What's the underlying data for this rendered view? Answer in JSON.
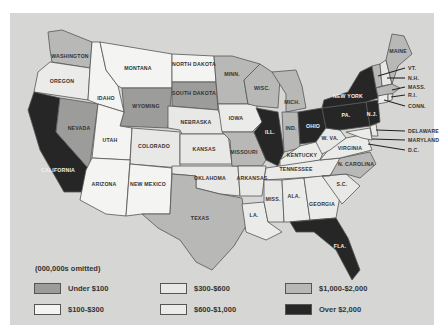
{
  "legend": {
    "title": "(000,000s omitted)",
    "items": [
      {
        "label": "Under $100",
        "color": "#9c9c9a"
      },
      {
        "label": "$100-$300",
        "color": "#f4f4f2"
      },
      {
        "label": "$300-$600",
        "color": "#e8e8e6"
      },
      {
        "label": "$600-$1,000",
        "color": "#ebebea"
      },
      {
        "label": "$1,000-$2,000",
        "color": "#b8b8b6"
      },
      {
        "label": "Over $2,000",
        "color": "#262626"
      }
    ]
  },
  "states": [
    {
      "label": "WASHINGTON",
      "category": "$1,000-$2,000"
    },
    {
      "label": "OREGON",
      "category": "$600-$1,000"
    },
    {
      "label": "CALIFORNIA",
      "category": "Over $2,000"
    },
    {
      "label": "NEVADA",
      "category": "Under $100"
    },
    {
      "label": "IDAHO",
      "category": "$100-$300"
    },
    {
      "label": "MONTANA",
      "category": "$100-$300"
    },
    {
      "label": "WYOMING",
      "category": "Under $100"
    },
    {
      "label": "UTAH",
      "category": "$100-$300"
    },
    {
      "label": "ARIZONA",
      "category": "$100-$300"
    },
    {
      "label": "COLORADO",
      "category": "$300-$600"
    },
    {
      "label": "NEW MEXICO",
      "category": "$100-$300"
    },
    {
      "label": "NORTH DAKOTA",
      "category": "$100-$300"
    },
    {
      "label": "SOUTH DAKOTA",
      "category": "Under $100"
    },
    {
      "label": "NEBRASKA",
      "category": "$300-$600"
    },
    {
      "label": "KANSAS",
      "category": "$300-$600"
    },
    {
      "label": "OKLAHOMA",
      "category": "$300-$600"
    },
    {
      "label": "TEXAS",
      "category": "$1,000-$2,000"
    },
    {
      "label": "MINN.",
      "category": "$1,000-$2,000"
    },
    {
      "label": "IOWA",
      "category": "$600-$1,000"
    },
    {
      "label": "MISSOURI",
      "category": "$1,000-$2,000"
    },
    {
      "label": "ARKANSAS",
      "category": "$300-$600"
    },
    {
      "label": "LA.",
      "category": "$600-$1,000"
    },
    {
      "label": "WISC.",
      "category": "$1,000-$2,000"
    },
    {
      "label": "ILL.",
      "category": "Over $2,000"
    },
    {
      "label": "MICH.",
      "category": "$1,000-$2,000"
    },
    {
      "label": "IND.",
      "category": "$1,000-$2,000"
    },
    {
      "label": "OHIO",
      "category": "Over $2,000"
    },
    {
      "label": "KENTUCKY",
      "category": "$600-$1,000"
    },
    {
      "label": "TENNESSEE",
      "category": "$600-$1,000"
    },
    {
      "label": "MISS.",
      "category": "$300-$600"
    },
    {
      "label": "ALA.",
      "category": "$600-$1,000"
    },
    {
      "label": "GEORGIA",
      "category": "$600-$1,000"
    },
    {
      "label": "FLA.",
      "category": "Over $2,000"
    },
    {
      "label": "S.C.",
      "category": "$300-$600"
    },
    {
      "label": "N. CAROLINA",
      "category": "$1,000-$2,000"
    },
    {
      "label": "VIRGINIA",
      "category": "$600-$1,000"
    },
    {
      "label": "W. VA.",
      "category": "$300-$600"
    },
    {
      "label": "PA.",
      "category": "Over $2,000"
    },
    {
      "label": "NEW YORK",
      "category": "Over $2,000"
    },
    {
      "label": "N.J.",
      "category": "Over $2,000"
    },
    {
      "label": "MAINE",
      "category": "$1,000-$2,000"
    },
    {
      "label": "VT.",
      "category": "$1,000-$2,000"
    },
    {
      "label": "N.H.",
      "category": "$300-$600"
    },
    {
      "label": "MASS.",
      "category": "$1,000-$2,000"
    },
    {
      "label": "R.I.",
      "category": "$300-$600"
    },
    {
      "label": "CONN.",
      "category": "$600-$1,000"
    },
    {
      "label": "DELAWARE",
      "category": "$300-$600"
    },
    {
      "label": "MARYLAND",
      "category": "$600-$1,000"
    },
    {
      "label": "D.C.",
      "category": "$300-$600"
    }
  ],
  "callouts": [
    "VT.",
    "N.H.",
    "MASS.",
    "R.I.",
    "CONN.",
    "DELAWARE",
    "MARYLAND",
    "D.C."
  ]
}
